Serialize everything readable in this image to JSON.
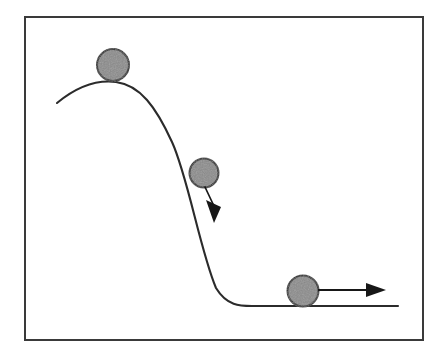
{
  "figure": {
    "description": "A line diagram showing a gray ball at three positions along a descending S-shaped slope, with motion arrows indicating direction of travel.",
    "canvas": {
      "width": 447,
      "height": 357,
      "background": "#ffffff"
    },
    "frame": {
      "name": "figure-border",
      "x": 25,
      "y": 17,
      "width": 398,
      "height": 323,
      "stroke": "#3a3a3a",
      "stroke_width": 2,
      "fill": "none"
    },
    "slope": {
      "name": "slope-curve",
      "stroke": "#2b2b2b",
      "stroke_width": 2.1,
      "fill": "none",
      "path": "M 57 103 C 80 84, 100 80, 116 82 C 140 85, 156 107, 172 142 C 188 177, 200 250, 216 288 C 227 306, 240 306, 252 306 L 398 306",
      "start_point": [
        57,
        103
      ],
      "crest_point": [
        116,
        82
      ],
      "end_point": [
        398,
        306
      ],
      "ground_level_y": 306
    },
    "balls": [
      {
        "name": "ball-top",
        "label": "ball at crest",
        "cx": 113,
        "cy": 65,
        "r": 16,
        "fill": "#8a8a8a",
        "stroke": "#242424",
        "stroke_width": 2
      },
      {
        "name": "ball-middle",
        "label": "ball on slope",
        "cx": 204,
        "cy": 173,
        "r": 14.5,
        "fill": "#8a8a8a",
        "stroke": "#242424",
        "stroke_width": 2
      },
      {
        "name": "ball-bottom",
        "label": "ball on flat ground",
        "cx": 303,
        "cy": 291,
        "r": 15.5,
        "fill": "#8a8a8a",
        "stroke": "#242424",
        "stroke_width": 2
      }
    ],
    "arrows": [
      {
        "name": "arrow-slope-motion",
        "label": "downhill motion arrow",
        "direction": "down-right",
        "shaft_start": [
          205,
          187
        ],
        "shaft_end": [
          213,
          203
        ],
        "tip": [
          219,
          223
        ],
        "stroke": "#171717",
        "stroke_width": 1.6,
        "head_fill": "#171717"
      },
      {
        "name": "arrow-ground-motion",
        "label": "horizontal motion arrow",
        "direction": "right",
        "shaft_start": [
          319,
          290
        ],
        "shaft_end": [
          370,
          290
        ],
        "tip": [
          386,
          290
        ],
        "stroke": "#171717",
        "stroke_width": 2,
        "head_fill": "#171717"
      }
    ],
    "colors": {
      "ball_fill": "#8a8a8a",
      "ball_outline": "#242424",
      "line": "#2b2b2b",
      "frame": "#3a3a3a",
      "arrow": "#171717",
      "background": "#ffffff"
    }
  }
}
